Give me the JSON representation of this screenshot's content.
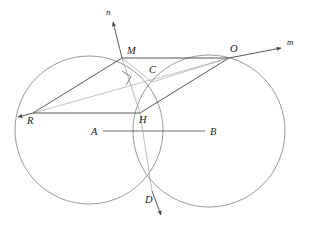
{
  "figure": {
    "background_color": "#ffffff",
    "width": 312,
    "height": 228,
    "colors": {
      "circle_stroke": "#8c8c8c",
      "chord_dark": "#3a3a3a",
      "chord_light": "#9a9a9a",
      "ray_stroke": "#4a4a4a",
      "label_fill": "#1a1a1a",
      "right_angle_stroke": "#5a5a5a"
    },
    "circles": [
      {
        "name": "left-circle",
        "cx": 89,
        "cy": 130,
        "r": 74
      },
      {
        "name": "right-circle",
        "cx": 209,
        "cy": 131,
        "r": 76
      }
    ],
    "points": [
      {
        "id": "M",
        "label": "M",
        "x": 122,
        "y": 58,
        "label_x": 127,
        "label_y": 54
      },
      {
        "id": "O",
        "label": "O",
        "x": 229,
        "y": 58,
        "label_x": 230,
        "label_y": 52
      },
      {
        "id": "C",
        "label": "C",
        "x": 152,
        "y": 82,
        "label_x": 150,
        "label_y": 73
      },
      {
        "id": "R",
        "label": "R",
        "x": 33,
        "y": 113,
        "label_x": 28,
        "label_y": 124
      },
      {
        "id": "H",
        "label": "H",
        "x": 140,
        "y": 113,
        "label_x": 140,
        "label_y": 122
      },
      {
        "id": "A",
        "label": "A",
        "x": 103,
        "y": 131,
        "label_x": 92,
        "label_y": 135
      },
      {
        "id": "B",
        "label": "B",
        "x": 205,
        "y": 131,
        "label_x": 210,
        "label_y": 135
      },
      {
        "id": "D",
        "label": "D",
        "x": 152,
        "y": 191,
        "label_x": 145,
        "label_y": 202
      }
    ],
    "rays": [
      {
        "id": "n",
        "label": "n",
        "from": "M",
        "x1": 122,
        "y1": 58,
        "x2": 112,
        "y2": 20,
        "label_x": 106,
        "label_y": 14
      },
      {
        "id": "m",
        "label": "m",
        "from": "O",
        "x1": 229,
        "y1": 58,
        "x2": 283,
        "y2": 47,
        "label_x": 288,
        "label_y": 45
      },
      {
        "id": "r-arrow",
        "label": "",
        "from": "R",
        "x1": 33,
        "y1": 113,
        "x2": 16,
        "y2": 118,
        "label_x": 0,
        "label_y": 0
      },
      {
        "id": "d-arrow",
        "label": "",
        "from": "D",
        "x1": 152,
        "y1": 191,
        "x2": 163,
        "y2": 218,
        "label_x": 0,
        "label_y": 0
      }
    ],
    "segments": [
      {
        "id": "MO",
        "from": "M",
        "to": "O",
        "weight": "dark",
        "x1": 122,
        "y1": 58,
        "x2": 229,
        "y2": 58
      },
      {
        "id": "RM",
        "from": "R",
        "to": "M",
        "weight": "dark",
        "x1": 33,
        "y1": 113,
        "x2": 122,
        "y2": 58
      },
      {
        "id": "RO",
        "from": "R",
        "to": "O",
        "weight": "light",
        "x1": 33,
        "y1": 113,
        "x2": 229,
        "y2": 58
      },
      {
        "id": "RH",
        "from": "R",
        "to": "H",
        "weight": "dark",
        "x1": 33,
        "y1": 113,
        "x2": 140,
        "y2": 113
      },
      {
        "id": "HO",
        "from": "H",
        "to": "O",
        "weight": "dark",
        "x1": 140,
        "y1": 113,
        "x2": 229,
        "y2": 58
      },
      {
        "id": "MH",
        "from": "M",
        "to": "H",
        "weight": "light",
        "x1": 122,
        "y1": 58,
        "x2": 140,
        "y2": 113
      },
      {
        "id": "HD",
        "from": "H",
        "to": "D",
        "weight": "light",
        "x1": 140,
        "y1": 113,
        "x2": 152,
        "y2": 191
      },
      {
        "id": "MC",
        "from": "M",
        "to": "C",
        "weight": "light",
        "x1": 122,
        "y1": 58,
        "x2": 152,
        "y2": 82
      },
      {
        "id": "CO",
        "from": "C",
        "to": "O",
        "weight": "light",
        "x1": 152,
        "y1": 82,
        "x2": 229,
        "y2": 58
      },
      {
        "id": "AB",
        "from": "A",
        "to": "B",
        "weight": "dark",
        "x1": 103,
        "y1": 131,
        "x2": 205,
        "y2": 131
      }
    ],
    "right_angle": {
      "name": "right-angle-mark-at-MH-MC",
      "points": "123,72 131,78 126,85"
    }
  }
}
